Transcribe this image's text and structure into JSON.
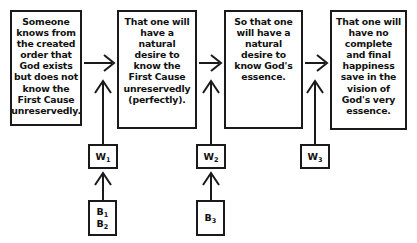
{
  "diagram": {
    "stroke_color": "#1a1a1a",
    "background_color": "#ffffff",
    "claims": [
      {
        "id": "claim-1",
        "text": "Someone knows from the created order that God exists but does not know the First Cause unreservedly."
      },
      {
        "id": "claim-2",
        "text": "That one will have a natural desire to know the First Cause unreservedly (perfectly)."
      },
      {
        "id": "claim-3",
        "text": "So that one will have a natural desire to know God's essence."
      },
      {
        "id": "claim-4",
        "text": "That one will have no complete and final happiness save in the vision of God's very essence."
      }
    ],
    "warrants": [
      {
        "id": "warrant-1",
        "letter": "W",
        "index": "1"
      },
      {
        "id": "warrant-2",
        "letter": "W",
        "index": "2"
      },
      {
        "id": "warrant-3",
        "letter": "W",
        "index": "3"
      }
    ],
    "backings": [
      {
        "id": "backing-1",
        "lines": [
          {
            "letter": "B",
            "index": "1"
          },
          {
            "letter": "B",
            "index": "2"
          }
        ]
      },
      {
        "id": "backing-2",
        "lines": [
          {
            "letter": "B",
            "index": "3"
          }
        ]
      }
    ],
    "arrows": {
      "horizontal_label": "implies",
      "vertical_label": "supports"
    }
  }
}
